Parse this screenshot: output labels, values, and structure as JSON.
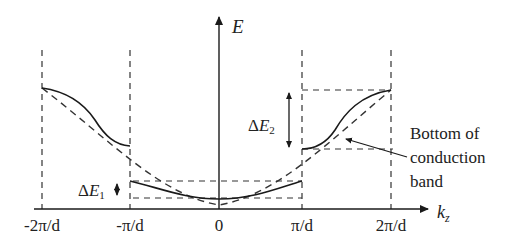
{
  "figure": {
    "type": "band-structure-diagram",
    "axes": {
      "y_label": "E",
      "x_label_main": "k",
      "x_label_sub": "z"
    },
    "x_ticks": [
      {
        "label": "-2π/d",
        "x": 42
      },
      {
        "label": "-π/d",
        "x": 130
      },
      {
        "label": "0",
        "x": 219
      },
      {
        "label": "π/d",
        "x": 302
      },
      {
        "label": "2π/d",
        "x": 391
      }
    ],
    "annotations": {
      "delta_e1": {
        "delta": "Δ",
        "var": "E",
        "sub": "1"
      },
      "delta_e2": {
        "delta": "Δ",
        "var": "E",
        "sub": "2"
      },
      "note_lines": [
        "Bottom of",
        "conduction",
        "band"
      ]
    },
    "curves": {
      "solid": "perturbed energy bands with gaps at zone boundaries",
      "dashed": "free-electron parabola"
    },
    "colors": {
      "line": "#1a1a1a",
      "dash": "#333333",
      "background": "#ffffff"
    }
  }
}
